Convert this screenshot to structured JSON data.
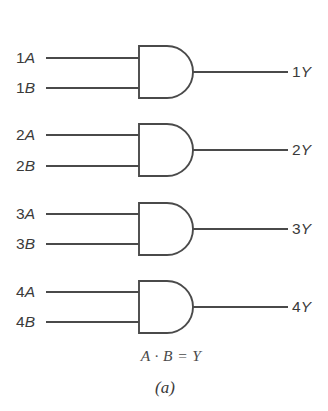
{
  "figure": {
    "caption": "(a)",
    "formula": "A · B = Y",
    "background_color": "#ffffff",
    "line_color": "#4a4a4a",
    "text_color": "#3a3a3a",
    "gate_type": "AND",
    "gate_count": 4
  },
  "gates": [
    {
      "index": 1,
      "input_a_label": "1A",
      "input_b_label": "1B",
      "output_label": "1Y"
    },
    {
      "index": 2,
      "input_a_label": "2A",
      "input_b_label": "2B",
      "output_label": "2Y"
    },
    {
      "index": 3,
      "input_a_label": "3A",
      "input_b_label": "3B",
      "output_label": "3Y"
    },
    {
      "index": 4,
      "input_a_label": "4A",
      "input_b_label": "4B",
      "output_label": "4Y"
    }
  ],
  "chart_data": {
    "type": "diagram",
    "title": "(a)",
    "subtitle": "A · B = Y",
    "elements": [
      {
        "gate": 1,
        "inputs": [
          "1A",
          "1B"
        ],
        "output": "1Y",
        "symbol": "AND"
      },
      {
        "gate": 2,
        "inputs": [
          "2A",
          "2B"
        ],
        "output": "2Y",
        "symbol": "AND"
      },
      {
        "gate": 3,
        "inputs": [
          "3A",
          "3B"
        ],
        "output": "3Y",
        "symbol": "AND"
      },
      {
        "gate": 4,
        "inputs": [
          "4A",
          "4B"
        ],
        "output": "4Y",
        "symbol": "AND"
      }
    ]
  }
}
